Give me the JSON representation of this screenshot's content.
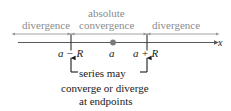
{
  "figure": {
    "title_text_present": false,
    "width": 231,
    "height": 111,
    "background": "#ffffff"
  },
  "colors": {
    "region_label": "#8c8c8c",
    "range_line": "#9a9a9a",
    "axis_line": "#595959",
    "tick": "#3a3a3a",
    "point_dot": "#7a7a7a",
    "text": "#1a1a1a",
    "bracket": "#1a1a1a"
  },
  "regions": [
    {
      "id": "divergence-left",
      "label": "divergence"
    },
    {
      "id": "absolute",
      "label": "absolute"
    },
    {
      "id": "convergence",
      "label": "convergence"
    },
    {
      "id": "divergence-right",
      "label": "divergence"
    }
  ],
  "axis": {
    "variable_label": "x",
    "points": [
      {
        "id": "a-minus-r",
        "label": "a − R",
        "x": 71
      },
      {
        "id": "a-center",
        "label": "a",
        "x": 113
      },
      {
        "id": "a-plus-r",
        "label": "a + R",
        "x": 147
      }
    ]
  },
  "caption": {
    "line1": "series may",
    "line2": "converge or diverge",
    "line3": "at endpoints"
  }
}
